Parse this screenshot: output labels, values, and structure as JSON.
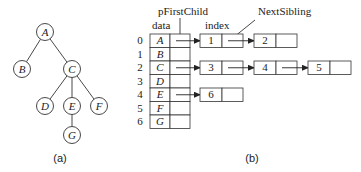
{
  "tree": {
    "caption": "(a)",
    "nodes": [
      {
        "id": "A",
        "label": "A",
        "x": 45,
        "y": 32
      },
      {
        "id": "B",
        "label": "B",
        "x": 22,
        "y": 69
      },
      {
        "id": "C",
        "label": "C",
        "x": 72,
        "y": 69
      },
      {
        "id": "D",
        "label": "D",
        "x": 45,
        "y": 106
      },
      {
        "id": "E",
        "label": "E",
        "x": 72,
        "y": 106
      },
      {
        "id": "F",
        "label": "F",
        "x": 99,
        "y": 106
      },
      {
        "id": "G",
        "label": "G",
        "x": 72,
        "y": 135
      }
    ],
    "edges": [
      [
        "A",
        "B"
      ],
      [
        "A",
        "C"
      ],
      [
        "C",
        "D"
      ],
      [
        "C",
        "E"
      ],
      [
        "C",
        "F"
      ],
      [
        "E",
        "G"
      ]
    ]
  },
  "storage": {
    "caption": "(b)",
    "labels": {
      "pFirstChild": "pFirstChild",
      "NextSibling": "NextSibling",
      "data": "data",
      "index": "index"
    },
    "rows": [
      {
        "index": "0",
        "data": "A",
        "children": [
          "1",
          "2"
        ]
      },
      {
        "index": "1",
        "data": "B",
        "children": []
      },
      {
        "index": "2",
        "data": "C",
        "children": [
          "3",
          "4",
          "5"
        ]
      },
      {
        "index": "3",
        "data": "D",
        "children": []
      },
      {
        "index": "4",
        "data": "E",
        "children": [
          "6"
        ]
      },
      {
        "index": "5",
        "data": "F",
        "children": []
      },
      {
        "index": "6",
        "data": "G",
        "children": []
      }
    ]
  }
}
